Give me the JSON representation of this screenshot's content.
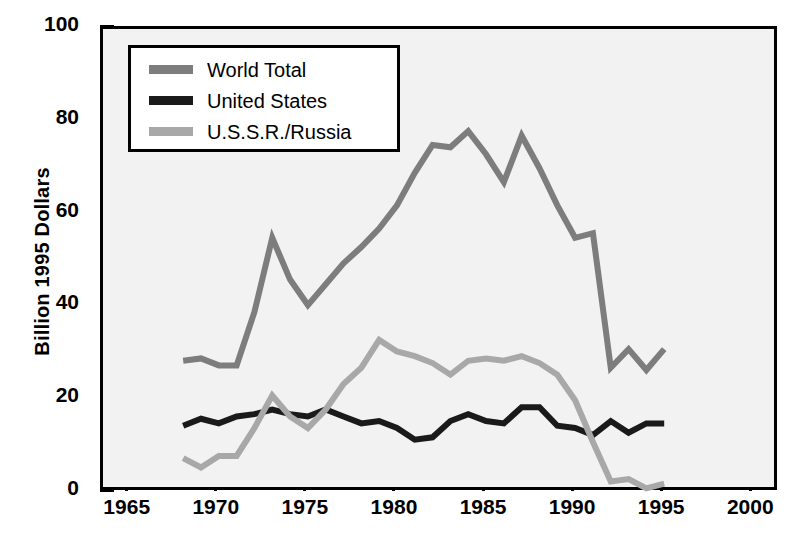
{
  "chart_data": {
    "type": "line",
    "title": "",
    "xlabel": "",
    "ylabel": "Billion 1995 Dollars",
    "xlim": [
      1963.5,
      2001.5
    ],
    "ylim": [
      0,
      100
    ],
    "xticks": [
      1965,
      1970,
      1975,
      1980,
      1985,
      1990,
      1995,
      2000
    ],
    "yticks": [
      0,
      20,
      40,
      60,
      80,
      100
    ],
    "yticks_minor": [
      10,
      30,
      50,
      70,
      90
    ],
    "grid": false,
    "legend_position": "top-left",
    "series": [
      {
        "name": "World Total",
        "color": "#7d7d7d",
        "x": [
          1968,
          1969,
          1970,
          1971,
          1972,
          1973,
          1974,
          1975,
          1976,
          1977,
          1978,
          1979,
          1980,
          1981,
          1982,
          1983,
          1984,
          1985,
          1986,
          1987,
          1988,
          1989,
          1990,
          1991,
          1992,
          1993,
          1994,
          1995
        ],
        "values": [
          28.5,
          29,
          27.5,
          27.5,
          39,
          55,
          46,
          40.5,
          45,
          49.5,
          53,
          57,
          62,
          69,
          75,
          74.5,
          78,
          73,
          67,
          77,
          70,
          62,
          55,
          56,
          27,
          31,
          26.5,
          31
        ]
      },
      {
        "name": "United States",
        "color": "#1a1a1a",
        "x": [
          1968,
          1969,
          1970,
          1971,
          1972,
          1973,
          1974,
          1975,
          1976,
          1977,
          1978,
          1979,
          1980,
          1981,
          1982,
          1983,
          1984,
          1985,
          1986,
          1987,
          1988,
          1989,
          1990,
          1991,
          1992,
          1993,
          1994,
          1995
        ],
        "values": [
          14.5,
          16,
          15,
          16.5,
          17,
          18,
          17,
          16.5,
          18,
          16.5,
          15,
          15.5,
          14,
          11.5,
          12,
          15.5,
          17,
          15.5,
          15,
          18.5,
          18.5,
          14.5,
          14,
          12.5,
          15.5,
          13,
          15,
          15
        ]
      },
      {
        "name": "U.S.S.R./Russia",
        "color": "#a8a8a8",
        "x": [
          1968,
          1969,
          1970,
          1971,
          1972,
          1973,
          1974,
          1975,
          1976,
          1977,
          1978,
          1979,
          1980,
          1981,
          1982,
          1983,
          1984,
          1985,
          1986,
          1987,
          1988,
          1989,
          1990,
          1991,
          1992,
          1993,
          1994,
          1995
        ],
        "values": [
          7.5,
          5.5,
          8,
          8,
          14,
          21,
          16.5,
          14,
          18,
          23.5,
          27,
          33,
          30.5,
          29.5,
          28,
          25.5,
          28.5,
          29,
          28.5,
          29.5,
          28,
          25.5,
          20,
          11,
          2.5,
          3,
          1,
          2
        ]
      }
    ]
  },
  "legend": {
    "items": [
      {
        "label": "World Total"
      },
      {
        "label": "United States"
      },
      {
        "label": "U.S.S.R./Russia"
      }
    ]
  },
  "axis": {
    "y_title": "Billion 1995 Dollars",
    "y_labels": [
      "0",
      "20",
      "40",
      "60",
      "80",
      "100"
    ],
    "x_labels": [
      "1965",
      "1970",
      "1975",
      "1980",
      "1985",
      "1990",
      "1995",
      "2000"
    ]
  }
}
